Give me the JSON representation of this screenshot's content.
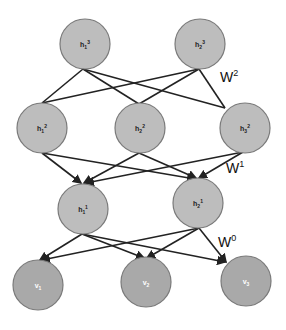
{
  "diagram": {
    "type": "layered neural network (deep belief network)",
    "colors": {
      "hidden_fill": "#bdbdbd",
      "visible_fill": "#a9a9a9",
      "node_stroke": "#7a7a7a",
      "edge": "#222222",
      "hidden_label": "#222222",
      "visible_label": "#ffffff",
      "weight_label": "#111111"
    },
    "layers": [
      {
        "name": "hidden-3",
        "nodes": [
          {
            "id": "h1_3",
            "base": "h",
            "sub": "1",
            "sup": "3",
            "cx": 85,
            "cy": 44,
            "r": 25
          },
          {
            "id": "h2_3",
            "base": "h",
            "sub": "2",
            "sup": "3",
            "cx": 200,
            "cy": 44,
            "r": 25
          }
        ]
      },
      {
        "name": "hidden-2",
        "nodes": [
          {
            "id": "h1_2",
            "base": "h",
            "sub": "1",
            "sup": "2",
            "cx": 42,
            "cy": 128,
            "r": 25
          },
          {
            "id": "h2_2",
            "base": "h",
            "sub": "2",
            "sup": "2",
            "cx": 140,
            "cy": 128,
            "r": 25
          },
          {
            "id": "h3_2",
            "base": "h",
            "sub": "3",
            "sup": "2",
            "cx": 245,
            "cy": 128,
            "r": 25
          }
        ]
      },
      {
        "name": "hidden-1",
        "nodes": [
          {
            "id": "h1_1",
            "base": "h",
            "sub": "1",
            "sup": "1",
            "cx": 83,
            "cy": 209,
            "r": 25
          },
          {
            "id": "h2_1",
            "base": "h",
            "sub": "2",
            "sup": "1",
            "cx": 198,
            "cy": 203,
            "r": 25
          }
        ]
      },
      {
        "name": "visible",
        "nodes": [
          {
            "id": "v1",
            "base": "v",
            "sub": "1",
            "sup": "",
            "cx": 38,
            "cy": 285,
            "r": 25
          },
          {
            "id": "v2",
            "base": "v",
            "sub": "2",
            "sup": "",
            "cx": 146,
            "cy": 282,
            "r": 25
          },
          {
            "id": "v3",
            "base": "v",
            "sub": "3",
            "sup": "",
            "cx": 246,
            "cy": 281,
            "r": 25
          }
        ]
      }
    ],
    "weights": [
      {
        "base": "W",
        "sup": "2",
        "x": 220,
        "y": 82
      },
      {
        "base": "W",
        "sup": "1",
        "x": 226,
        "y": 173
      },
      {
        "base": "W",
        "sup": "0",
        "x": 218,
        "y": 247
      }
    ],
    "edges": [
      {
        "from": "h1_3",
        "to": "h1_2",
        "x1": 83,
        "y1": 69,
        "x2": 42,
        "y2": 103,
        "arrow": false
      },
      {
        "from": "h1_3",
        "to": "h2_2",
        "x1": 83,
        "y1": 69,
        "x2": 139,
        "y2": 104,
        "arrow": false
      },
      {
        "from": "h1_3",
        "to": "h3_2",
        "x1": 83,
        "y1": 69,
        "x2": 225,
        "y2": 108,
        "arrow": false
      },
      {
        "from": "h2_3",
        "to": "h1_2",
        "x1": 199,
        "y1": 69,
        "x2": 42,
        "y2": 103,
        "arrow": false
      },
      {
        "from": "h2_3",
        "to": "h2_2",
        "x1": 199,
        "y1": 69,
        "x2": 139,
        "y2": 104,
        "arrow": false
      },
      {
        "from": "h2_3",
        "to": "h3_2",
        "x1": 199,
        "y1": 69,
        "x2": 225,
        "y2": 108,
        "arrow": false
      },
      {
        "from": "h1_2",
        "to": "h1_1",
        "x1": 42,
        "y1": 153,
        "x2": 81,
        "y2": 183,
        "arrow": true
      },
      {
        "from": "h1_2",
        "to": "h2_1",
        "x1": 42,
        "y1": 153,
        "x2": 195,
        "y2": 179,
        "arrow": true
      },
      {
        "from": "h2_2",
        "to": "h1_1",
        "x1": 139,
        "y1": 153,
        "x2": 84,
        "y2": 183,
        "arrow": true
      },
      {
        "from": "h2_2",
        "to": "h2_1",
        "x1": 139,
        "y1": 153,
        "x2": 196,
        "y2": 178,
        "arrow": true
      },
      {
        "from": "h3_2",
        "to": "h1_1",
        "x1": 243,
        "y1": 152,
        "x2": 86,
        "y2": 183,
        "arrow": true
      },
      {
        "from": "h3_2",
        "to": "h2_1",
        "x1": 243,
        "y1": 152,
        "x2": 199,
        "y2": 178,
        "arrow": true
      },
      {
        "from": "h1_1",
        "to": "v1",
        "x1": 82,
        "y1": 234,
        "x2": 40,
        "y2": 260,
        "arrow": true
      },
      {
        "from": "h1_1",
        "to": "v2",
        "x1": 82,
        "y1": 234,
        "x2": 144,
        "y2": 258,
        "arrow": true
      },
      {
        "from": "h1_1",
        "to": "v3",
        "x1": 82,
        "y1": 234,
        "x2": 225,
        "y2": 262,
        "arrow": true
      },
      {
        "from": "h2_1",
        "to": "v1",
        "x1": 199,
        "y1": 228,
        "x2": 42,
        "y2": 260,
        "arrow": true
      },
      {
        "from": "h2_1",
        "to": "v2",
        "x1": 199,
        "y1": 228,
        "x2": 147,
        "y2": 258,
        "arrow": true
      },
      {
        "from": "h2_1",
        "to": "v3",
        "x1": 199,
        "y1": 228,
        "x2": 226,
        "y2": 262,
        "arrow": true
      }
    ]
  }
}
